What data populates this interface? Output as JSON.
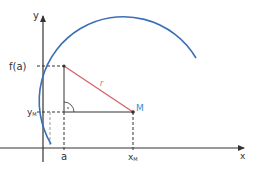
{
  "diagram": {
    "axes": {
      "x_label": "x",
      "y_label": "y"
    },
    "labels": {
      "f_a": "f(a)",
      "y_m_base": "y",
      "y_m_sub": "M",
      "a": "a",
      "x_m_base": "x",
      "x_m_sub": "M",
      "radius": "r",
      "center": "M"
    },
    "colors": {
      "circle": "#3a6fb5",
      "radius": "#d9626a",
      "axes": "#333333",
      "center_label": "#3a8fd0"
    }
  }
}
